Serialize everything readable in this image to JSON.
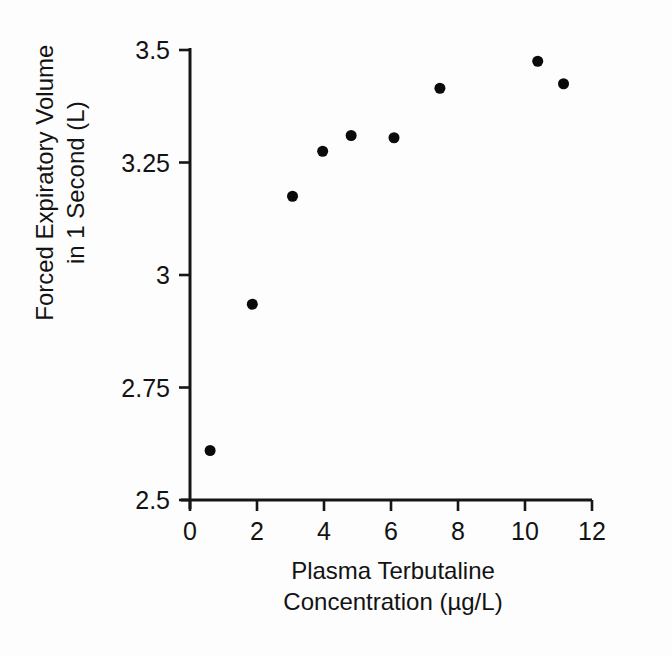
{
  "chart_data": {
    "type": "scatter",
    "title": "",
    "xlabel": "Plasma Terbutaline Concentration (µg/L)",
    "xlabel_lines": [
      "Plasma Terbutaline",
      "Concentration (µg/L)"
    ],
    "ylabel": "Forced Expiratory Volume in 1 Second (L)",
    "ylabel_lines": [
      "Forced Expiratory Volume",
      "in 1 Second (L)"
    ],
    "xlim": [
      0,
      12
    ],
    "ylim": [
      2.5,
      3.5
    ],
    "xticks": [
      0,
      2,
      4,
      6,
      8,
      10,
      12
    ],
    "yticks": [
      2.5,
      2.75,
      3,
      3.25,
      3.5
    ],
    "xtick_labels": [
      "0",
      "2",
      "4",
      "6",
      "8",
      "10",
      "12"
    ],
    "ytick_labels": [
      "2.5",
      "2.75",
      "3",
      "3.25",
      "3.5"
    ],
    "grid": false,
    "legend": false,
    "marker": {
      "shape": "circle",
      "color": "#0a0a0a",
      "size_px": 11
    },
    "x": [
      0.6,
      1.86,
      3.06,
      3.96,
      4.81,
      6.09,
      7.46,
      10.38,
      11.15
    ],
    "y": [
      2.61,
      2.935,
      3.175,
      3.275,
      3.31,
      3.305,
      3.415,
      3.475,
      3.425
    ],
    "points": [
      {
        "x": 0.6,
        "y": 2.61
      },
      {
        "x": 1.86,
        "y": 2.935
      },
      {
        "x": 3.06,
        "y": 3.175
      },
      {
        "x": 3.96,
        "y": 3.275
      },
      {
        "x": 4.81,
        "y": 3.31
      },
      {
        "x": 6.09,
        "y": 3.305
      },
      {
        "x": 7.46,
        "y": 3.415
      },
      {
        "x": 10.38,
        "y": 3.475
      },
      {
        "x": 11.15,
        "y": 3.425
      }
    ]
  }
}
